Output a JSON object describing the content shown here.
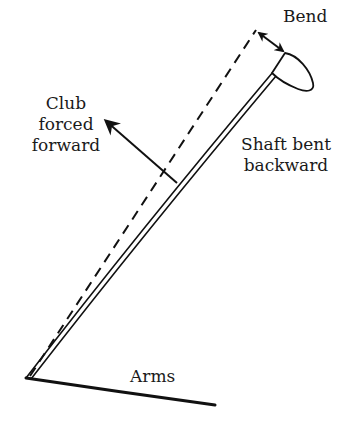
{
  "diagram": {
    "type": "golf-club-shaft-bending",
    "labels": {
      "bend": "Bend",
      "club_forced_forward": [
        "Club",
        "forced",
        "forward"
      ],
      "shaft_bent_backward": [
        "Shaft bent",
        "backward"
      ],
      "arms": "Arms"
    },
    "elements": [
      {
        "name": "straight-shaft-reference",
        "style": "dashed",
        "from": [
          28,
          378
        ],
        "to": [
          255,
          30
        ]
      },
      {
        "name": "bent-shaft",
        "style": "double-line",
        "from": [
          28,
          378
        ],
        "to": [
          275,
          75
        ]
      },
      {
        "name": "club-head",
        "style": "outline"
      },
      {
        "name": "bend-arrow",
        "style": "double-headed-arrow",
        "from": [
          257,
          32
        ],
        "to": [
          285,
          52
        ]
      },
      {
        "name": "force-arrow",
        "style": "arrow",
        "from": [
          177,
          183
        ],
        "to": [
          105,
          120
        ]
      },
      {
        "name": "arms-line",
        "style": "solid",
        "from": [
          27,
          378
        ],
        "to": [
          215,
          405
        ]
      }
    ],
    "colors": {
      "stroke": "#111111",
      "background": "#ffffff",
      "text": "#1a1a1a"
    }
  }
}
